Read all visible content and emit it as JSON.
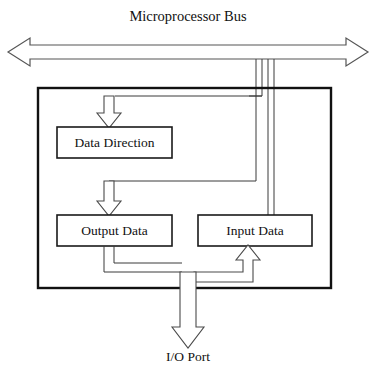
{
  "diagram": {
    "title": "Microprocessor Bus",
    "bottom_label": "I/O Port",
    "blocks": [
      {
        "id": "data-direction",
        "label": "Data Direction"
      },
      {
        "id": "output-data",
        "label": "Output Data"
      },
      {
        "id": "input-data",
        "label": "Input Data"
      }
    ],
    "colors": {
      "background": "#ffffff",
      "frame": "#111111",
      "box_stroke": "#1a1a1a",
      "arrow_stroke": "#4a4a4a",
      "arrow_fill": "#ffffff",
      "text": "#111111"
    }
  }
}
